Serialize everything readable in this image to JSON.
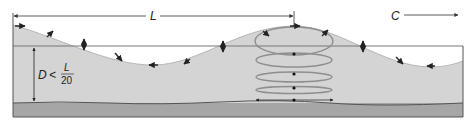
{
  "figure": {
    "type": "shallow-water wave orbital motion diagram",
    "labels": {
      "wavelength": "L",
      "celerity": "C",
      "depth_var": "D",
      "depth_relation": "<",
      "frac_numerator": "L",
      "frac_denominator": "20"
    },
    "colors": {
      "water": "#d4d4d4",
      "seabed": "#a6a6a6",
      "orbit": "#8e8e8e",
      "line": "#333333",
      "frame": "#555555",
      "background": "#ffffff"
    },
    "orbits": {
      "center_x": 294,
      "count": 5,
      "description": "ellipses flattening with depth to horizontal back-and-forth motion at the seabed"
    }
  }
}
